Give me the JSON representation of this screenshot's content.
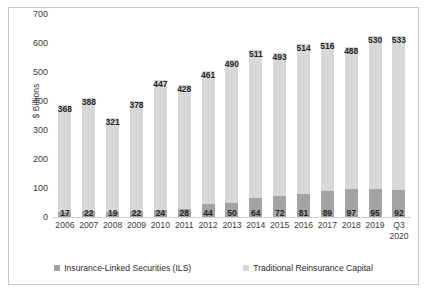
{
  "chart_data": {
    "type": "bar",
    "subtype": "stacked-bar",
    "title": "",
    "xlabel": "",
    "ylabel": "$ Billions",
    "ylim": [
      0,
      700
    ],
    "yticks": [
      700,
      600,
      500,
      400,
      300,
      200,
      100,
      0
    ],
    "grid": false,
    "legend_position": "bottom",
    "categories": [
      "2006",
      "2007",
      "2008",
      "2009",
      "2010",
      "2011",
      "2012",
      "2013",
      "2014",
      "2015",
      "2016",
      "2017",
      "2018",
      "2019",
      "Q3\n2020"
    ],
    "series": [
      {
        "name": "Insurance-Linked Securities (ILS)",
        "color": "#a3a3a3",
        "values": [
          17,
          22,
          19,
          22,
          24,
          28,
          44,
          50,
          64,
          72,
          81,
          89,
          97,
          95,
          92
        ]
      },
      {
        "name": "Traditional Reinsurance Capital",
        "color": "#d8d8d8",
        "values": [
          368,
          388,
          321,
          378,
          447,
          428,
          461,
          490,
          511,
          493,
          514,
          516,
          488,
          530,
          533
        ]
      }
    ],
    "totals": [
      385,
      410,
      340,
      400,
      471,
      456,
      505,
      540,
      575,
      565,
      595,
      605,
      585,
      625,
      625
    ]
  },
  "legend": {
    "items": [
      {
        "label": "Insurance-Linked Securities (ILS)",
        "color": "#a3a3a3"
      },
      {
        "label": "Traditional Reinsurance Capital",
        "color": "#d8d8d8"
      }
    ]
  }
}
